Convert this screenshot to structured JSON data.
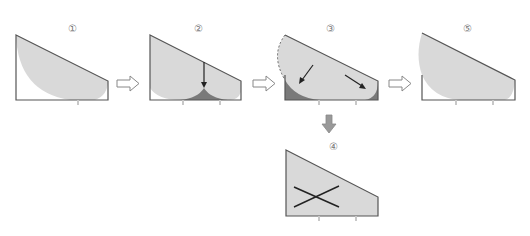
{
  "diagram": {
    "title": "",
    "steps": [
      {
        "id": "1",
        "label": "①"
      },
      {
        "id": "2",
        "label": "②"
      },
      {
        "id": "3",
        "label": "③"
      },
      {
        "id": "4",
        "label": "④"
      },
      {
        "id": "5",
        "label": "⑤"
      }
    ],
    "colors": {
      "outline": "#555555",
      "fill_light": "#d9d9d9",
      "fill_dark": "#7a7a7a",
      "arrow_hollow": "#888888",
      "arrow_solid": "#999999",
      "inlet": "#c8c8c8"
    },
    "connectors": [
      {
        "from": "1",
        "to": "2",
        "type": "hollow-arrow-right"
      },
      {
        "from": "2",
        "to": "3",
        "type": "hollow-arrow-right"
      },
      {
        "from": "3",
        "to": "5",
        "type": "hollow-arrow-right"
      },
      {
        "from": "3",
        "to": "4",
        "type": "solid-arrow-down"
      }
    ]
  }
}
